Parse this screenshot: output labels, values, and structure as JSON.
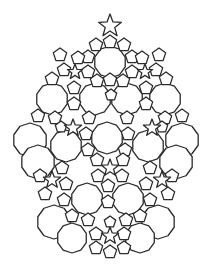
{
  "figure": {
    "title": "",
    "width": 211,
    "height": 269,
    "stroke_color": "#2b2b2b",
    "fill_color": "#ffffff",
    "background": "#ffffff"
  },
  "shapes": {
    "top_star": {
      "cx": 110,
      "cy": 26,
      "r": 12,
      "rot": -90
    },
    "decagons": [
      {
        "cx": 110,
        "cy": 62,
        "r": 16
      },
      {
        "cx": 52,
        "cy": 99,
        "r": 16
      },
      {
        "cx": 95,
        "cy": 99,
        "r": 16
      },
      {
        "cx": 127,
        "cy": 99,
        "r": 16
      },
      {
        "cx": 165,
        "cy": 99,
        "r": 16
      },
      {
        "cx": 107,
        "cy": 138,
        "r": 16
      },
      {
        "cx": 66,
        "cy": 146,
        "r": 16
      },
      {
        "cx": 148,
        "cy": 146,
        "r": 16
      },
      {
        "cx": 87,
        "cy": 199,
        "r": 16
      },
      {
        "cx": 128,
        "cy": 199,
        "r": 16
      }
    ],
    "lobes": [
      {
        "cx": 30,
        "cy": 140,
        "r": 17
      },
      {
        "cx": 38,
        "cy": 162,
        "r": 17
      },
      {
        "cx": 182,
        "cy": 140,
        "r": 17
      },
      {
        "cx": 176,
        "cy": 162,
        "r": 17
      },
      {
        "cx": 54,
        "cy": 222,
        "r": 17
      },
      {
        "cx": 72,
        "cy": 238,
        "r": 15
      },
      {
        "cx": 158,
        "cy": 222,
        "r": 17
      },
      {
        "cx": 140,
        "cy": 238,
        "r": 15
      }
    ],
    "stars": [
      {
        "cx": 73,
        "cy": 128,
        "r": 9
      },
      {
        "cx": 152,
        "cy": 128,
        "r": 9
      },
      {
        "cx": 110,
        "cy": 168,
        "r": 9
      },
      {
        "cx": 52,
        "cy": 180,
        "r": 9
      },
      {
        "cx": 162,
        "cy": 180,
        "r": 9
      },
      {
        "cx": 110,
        "cy": 236,
        "r": 9
      },
      {
        "cx": 75,
        "cy": 72,
        "r": 8
      },
      {
        "cx": 145,
        "cy": 72,
        "r": 8
      }
    ],
    "pentagons": [
      {
        "cx": 110,
        "cy": 42,
        "r": 7
      },
      {
        "cx": 96,
        "cy": 45,
        "r": 7
      },
      {
        "cx": 124,
        "cy": 45,
        "r": 7
      },
      {
        "cx": 88,
        "cy": 57,
        "r": 7
      },
      {
        "cx": 132,
        "cy": 57,
        "r": 7
      },
      {
        "cx": 60,
        "cy": 55,
        "r": 7
      },
      {
        "cx": 78,
        "cy": 58,
        "r": 7
      },
      {
        "cx": 142,
        "cy": 58,
        "r": 7
      },
      {
        "cx": 159,
        "cy": 55,
        "r": 7
      },
      {
        "cx": 64,
        "cy": 70,
        "r": 7
      },
      {
        "cx": 88,
        "cy": 72,
        "r": 7
      },
      {
        "cx": 132,
        "cy": 72,
        "r": 7
      },
      {
        "cx": 156,
        "cy": 70,
        "r": 7
      },
      {
        "cx": 52,
        "cy": 79,
        "r": 7
      },
      {
        "cx": 97,
        "cy": 81,
        "r": 7
      },
      {
        "cx": 110,
        "cy": 80,
        "r": 7
      },
      {
        "cx": 123,
        "cy": 81,
        "r": 7
      },
      {
        "cx": 166,
        "cy": 79,
        "r": 7
      },
      {
        "cx": 74,
        "cy": 88,
        "r": 7
      },
      {
        "cx": 111,
        "cy": 95,
        "r": 6
      },
      {
        "cx": 146,
        "cy": 88,
        "r": 7
      },
      {
        "cx": 74,
        "cy": 104,
        "r": 7
      },
      {
        "cx": 146,
        "cy": 104,
        "r": 7
      },
      {
        "cx": 38,
        "cy": 116,
        "r": 7
      },
      {
        "cx": 55,
        "cy": 118,
        "r": 7
      },
      {
        "cx": 89,
        "cy": 118,
        "r": 7
      },
      {
        "cx": 127,
        "cy": 118,
        "r": 7
      },
      {
        "cx": 165,
        "cy": 118,
        "r": 7
      },
      {
        "cx": 182,
        "cy": 116,
        "r": 7
      },
      {
        "cx": 61,
        "cy": 127,
        "r": 6
      },
      {
        "cx": 86,
        "cy": 134,
        "r": 7
      },
      {
        "cx": 128,
        "cy": 134,
        "r": 7
      },
      {
        "cx": 162,
        "cy": 127,
        "r": 6
      },
      {
        "cx": 88,
        "cy": 150,
        "r": 7
      },
      {
        "cx": 125,
        "cy": 150,
        "r": 7
      },
      {
        "cx": 97,
        "cy": 160,
        "r": 7
      },
      {
        "cx": 123,
        "cy": 160,
        "r": 7
      },
      {
        "cx": 40,
        "cy": 176,
        "r": 7
      },
      {
        "cx": 62,
        "cy": 168,
        "r": 7
      },
      {
        "cx": 150,
        "cy": 168,
        "r": 7
      },
      {
        "cx": 172,
        "cy": 176,
        "r": 7
      },
      {
        "cx": 66,
        "cy": 184,
        "r": 7
      },
      {
        "cx": 146,
        "cy": 184,
        "r": 7
      },
      {
        "cx": 98,
        "cy": 176,
        "r": 7
      },
      {
        "cx": 122,
        "cy": 176,
        "r": 7
      },
      {
        "cx": 108,
        "cy": 186,
        "r": 7
      },
      {
        "cx": 45,
        "cy": 194,
        "r": 7
      },
      {
        "cx": 64,
        "cy": 200,
        "r": 7
      },
      {
        "cx": 150,
        "cy": 200,
        "r": 7
      },
      {
        "cx": 168,
        "cy": 194,
        "r": 7
      },
      {
        "cx": 72,
        "cy": 216,
        "r": 7
      },
      {
        "cx": 108,
        "cy": 202,
        "r": 7
      },
      {
        "cx": 140,
        "cy": 216,
        "r": 7
      },
      {
        "cx": 88,
        "cy": 220,
        "r": 7
      },
      {
        "cx": 126,
        "cy": 220,
        "r": 7
      },
      {
        "cx": 96,
        "cy": 234,
        "r": 7
      },
      {
        "cx": 124,
        "cy": 234,
        "r": 7
      },
      {
        "cx": 110,
        "cy": 222,
        "r": 6
      },
      {
        "cx": 96,
        "cy": 248,
        "r": 7
      },
      {
        "cx": 110,
        "cy": 252,
        "r": 7
      },
      {
        "cx": 124,
        "cy": 248,
        "r": 7
      }
    ]
  }
}
